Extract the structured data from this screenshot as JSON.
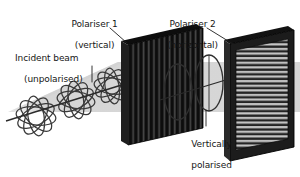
{
  "diagram": {
    "background_color": "#ffffff",
    "ink_color": "#161616",
    "labels": {
      "incident_beam": {
        "line1": "Incident beam",
        "line2": "(unpolarised)"
      },
      "polariser1": {
        "line1": "Polariser 1",
        "line2": "(vertical)"
      },
      "polariser2": {
        "line1": "Polariser 2",
        "line2": "(horizontal)"
      },
      "polarised_wave": {
        "line1": "Vertically",
        "line2": "polarised",
        "line3": "light wave"
      }
    },
    "elements": {
      "unpolarised_beam": {
        "name": "unpolarised-light-wave",
        "description": "four ring-bundles of ellipses at many orientations along the beam axis",
        "ring_bundle_count": 4,
        "rings_per_bundle": 5,
        "stroke_color": "#3a3a3a"
      },
      "polariser1_panel": {
        "name": "vertical-polariser",
        "slit_orientation": "vertical",
        "fill_color": "#1a1a1a",
        "slit_color": "#6e6e6e",
        "slit_count": 13
      },
      "polariser2_panel": {
        "name": "horizontal-polariser",
        "slit_orientation": "horizontal",
        "frame_color": "#1c1c1c",
        "slit_light_color": "#c9c9c9",
        "slit_dark_color": "#2a2a2a",
        "slit_count": 17
      },
      "polarised_wave": {
        "name": "vertically-polarised-light-wave",
        "description": "two vertical ellipses straddling the beam axis",
        "ellipse_count": 2,
        "stroke_color": "#2f2f2f"
      },
      "beam_envelope": {
        "name": "beam-envelope-band",
        "fill_color": "#d9d9d9"
      },
      "beam_axis": {
        "name": "beam-axis-line",
        "stroke_color": "#2b2b2b"
      }
    },
    "leader_lines": [
      {
        "name": "leader-incident-beam",
        "from": "Incident beam (unpolarised)",
        "to": "unpolarised-light-wave"
      },
      {
        "name": "leader-polariser-1",
        "from": "Polariser 1 (vertical)",
        "to": "vertical-polariser"
      },
      {
        "name": "leader-polariser-2",
        "from": "Polariser 2 (horizontal)",
        "to": "horizontal-polariser"
      },
      {
        "name": "leader-polarised-wave",
        "from": "Vertically polarised light wave",
        "to": "vertically-polarised-light-wave"
      }
    ]
  }
}
